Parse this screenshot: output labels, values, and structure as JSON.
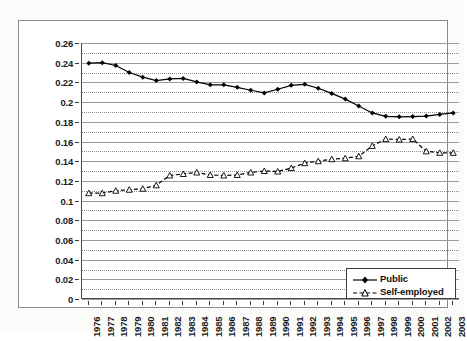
{
  "chart_data": {
    "type": "line",
    "title": "",
    "xlabel": "",
    "ylabel": "",
    "grid": true,
    "legend_position": "bottom-right",
    "ylim": [
      0,
      0.26
    ],
    "ytick_step": 0.02,
    "yticks": [
      "0",
      "0.02",
      "0.04",
      "0.06",
      "0.08",
      "0.1",
      "0.12",
      "0.14",
      "0.16",
      "0.18",
      "0.2",
      "0.22",
      "0.24",
      "0.26"
    ],
    "ytick_values": [
      0,
      0.02,
      0.04,
      0.06,
      0.08,
      0.1,
      0.12,
      0.14,
      0.16,
      0.18,
      0.2,
      0.22,
      0.24,
      0.26
    ],
    "minor_gridlines": true,
    "categories": [
      "1976",
      "1977",
      "1978",
      "1979",
      "1980",
      "1981",
      "1982",
      "1983",
      "1984",
      "1985",
      "1986",
      "1987",
      "1988",
      "1989",
      "1990",
      "1991",
      "1992",
      "1993",
      "1994",
      "1995",
      "1996",
      "1997",
      "1998",
      "1999",
      "2000",
      "2001",
      "2002",
      "2003"
    ],
    "series": [
      {
        "name": "Public",
        "marker": "filled-diamond",
        "line_style": "solid",
        "color": "#000000",
        "values": [
          0.2395,
          0.24,
          0.2372,
          0.23,
          0.2253,
          0.2218,
          0.2235,
          0.224,
          0.2205,
          0.2175,
          0.2175,
          0.215,
          0.212,
          0.2093,
          0.213,
          0.217,
          0.218,
          0.214,
          0.2088,
          0.203,
          0.196,
          0.189,
          0.1855,
          0.185,
          0.1853,
          0.1858,
          0.1875,
          0.189
        ]
      },
      {
        "name": "Self-employed",
        "marker": "open-triangle",
        "line_style": "dashed",
        "color": "#000000",
        "values": [
          0.1075,
          0.1075,
          0.11,
          0.111,
          0.112,
          0.1155,
          0.1255,
          0.127,
          0.1285,
          0.126,
          0.1255,
          0.126,
          0.1285,
          0.13,
          0.1295,
          0.133,
          0.138,
          0.14,
          0.142,
          0.143,
          0.145,
          0.1555,
          0.1625,
          0.162,
          0.1625,
          0.15,
          0.1485,
          0.1485
        ]
      }
    ]
  },
  "legend": {
    "items": [
      {
        "label": "Public"
      },
      {
        "label": "Self-employed"
      }
    ]
  }
}
